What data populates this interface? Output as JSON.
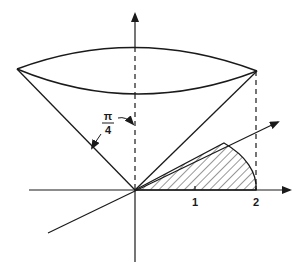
{
  "diagram": {
    "angle_label": {
      "numerator": "π",
      "denominator": "4"
    },
    "x_axis_ticks": [
      {
        "label": "1"
      },
      {
        "label": "2"
      }
    ],
    "colors": {
      "ink": "#1a1a1a",
      "background": "#ffffff"
    }
  }
}
